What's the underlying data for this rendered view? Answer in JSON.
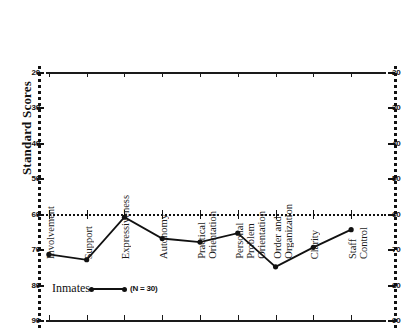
{
  "chart_data": {
    "type": "line",
    "title": "",
    "xlabel": "",
    "ylabel": "Standard Scores",
    "ylim": [
      20,
      90
    ],
    "yticks": [
      20,
      30,
      40,
      50,
      60,
      70,
      80,
      90
    ],
    "grid": false,
    "reference_line": 50,
    "legend_position": "bottom-left",
    "categories": [
      "Involvement",
      "Support",
      "Expressiveness",
      "Autonomy",
      "Practical\nOrientation",
      "Personal\nProblem\nOrientation",
      "Order and\nOrganization",
      "Clarity",
      "Staff\nControl"
    ],
    "series": [
      {
        "name": "Inmates",
        "n_label": "(N = 30)",
        "values": [
          38.5,
          37.0,
          49.0,
          43.0,
          42.0,
          44.5,
          35.0,
          40.5,
          45.5
        ]
      }
    ]
  },
  "axes": {
    "left_ticks": [
      "90",
      "80",
      "70",
      "60",
      "50",
      "40",
      "30",
      "20"
    ],
    "right_ticks": [
      "90",
      "80",
      "70",
      "60",
      "50",
      "40",
      "30",
      "20"
    ]
  }
}
